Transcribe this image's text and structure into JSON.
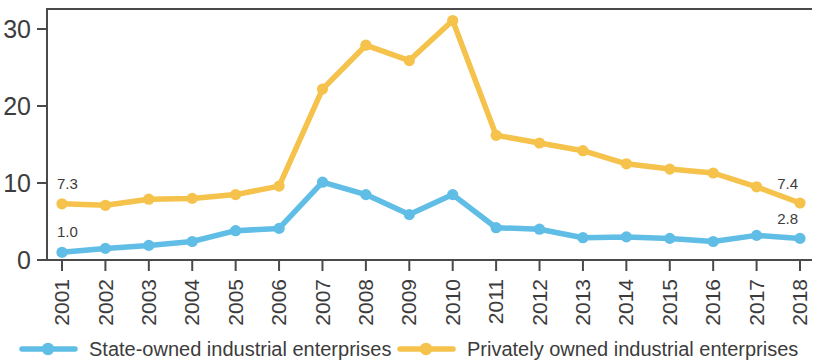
{
  "chart_data": {
    "type": "line",
    "title": "",
    "subtitle": "",
    "xlabel": "",
    "ylabel": "",
    "categories": [
      "2001",
      "2002",
      "2003",
      "2004",
      "2005",
      "2006",
      "2007",
      "2008",
      "2009",
      "2010",
      "2011",
      "2012",
      "2013",
      "2014",
      "2015",
      "2016",
      "2017",
      "2018"
    ],
    "xlim": [
      "2001",
      "2018"
    ],
    "ylim": [
      0,
      32
    ],
    "yticks": [
      0,
      10,
      20,
      30
    ],
    "ytick_labels": [
      "0",
      "10",
      "20",
      "30"
    ],
    "grid": false,
    "legend_position": "bottom",
    "xtick_rotation": -90,
    "series": [
      {
        "name": "State-owned industrial enterprises",
        "color": "#5FBDE6",
        "marker": "circle",
        "values": [
          1.0,
          1.5,
          1.9,
          2.4,
          3.8,
          4.1,
          10.1,
          8.5,
          5.9,
          8.5,
          4.2,
          4.0,
          2.9,
          3.0,
          2.8,
          2.4,
          3.2,
          2.8
        ],
        "start_label": "1.0",
        "end_label": "2.8"
      },
      {
        "name": "Privately owned industrial enterprises",
        "color": "#F5C24B",
        "marker": "circle",
        "values": [
          7.3,
          7.1,
          7.9,
          8.0,
          8.5,
          9.6,
          22.2,
          27.9,
          25.9,
          31.1,
          16.2,
          15.2,
          14.2,
          12.5,
          11.8,
          11.3,
          9.5,
          7.4
        ],
        "start_label": "7.3",
        "end_label": "7.4"
      }
    ],
    "annotations": [
      {
        "text": "7.3",
        "series": "Privately owned industrial enterprises",
        "position": "start"
      },
      {
        "text": "1.0",
        "series": "State-owned industrial enterprises",
        "position": "start"
      },
      {
        "text": "7.4",
        "series": "Privately owned industrial enterprises",
        "position": "end"
      },
      {
        "text": "2.8",
        "series": "State-owned industrial enterprises",
        "position": "end"
      }
    ]
  },
  "legend": {
    "items": [
      {
        "label": "State-owned industrial enterprises",
        "color": "#5FBDE6"
      },
      {
        "label": "Privately owned industrial enterprises",
        "color": "#F5C24B"
      }
    ]
  },
  "colors": {
    "state_owned": "#5FBDE6",
    "private_owned": "#F5C24B",
    "axis": "#4a4a4a",
    "text": "#3c3c3c",
    "background": "#ffffff"
  }
}
